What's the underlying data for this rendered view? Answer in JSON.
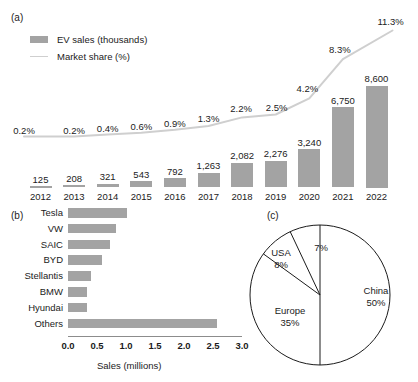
{
  "figure": {
    "panel_a_tag": "(a)",
    "panel_b_tag": "(b)",
    "panel_c_tag": "(c)"
  },
  "colors": {
    "bar_gray": "#a3a3a3",
    "line_gray": "#cfcfcf",
    "text": "#1b1b1b",
    "axis": "#8c8c8c",
    "pie_stroke": "#1b1b1b",
    "pie_fill": "#ffffff"
  },
  "panel_a": {
    "legend": [
      {
        "icon": "bar-swatch",
        "label": "EV sales (thousands)"
      },
      {
        "icon": "line-swatch",
        "label": "Market share (%)"
      }
    ]
  },
  "panel_b": {
    "x_axis_title": "Sales (millions)"
  },
  "chart_data": [
    {
      "id": "panel-a",
      "type": "bar",
      "title": "",
      "xlabel": "",
      "ylabel": "",
      "categories": [
        "2012",
        "2013",
        "2014",
        "2015",
        "2016",
        "2017",
        "2018",
        "2019",
        "2020",
        "2021",
        "2022"
      ],
      "ylim": [
        0,
        8600
      ],
      "grid": false,
      "legend_position": "top-left",
      "series": [
        {
          "name": "EV sales (thousands)",
          "type": "bar",
          "values": [
            125,
            208,
            321,
            543,
            792,
            1263,
            2082,
            2276,
            3240,
            6750,
            8600
          ],
          "data_labels": [
            "125",
            "208",
            "321",
            "543",
            "792",
            "1,263",
            "2,082",
            "2,276",
            "3,240",
            "6,750",
            "8,600"
          ]
        },
        {
          "name": "Market share (%)",
          "type": "line",
          "values": [
            0.2,
            0.2,
            0.4,
            0.6,
            0.9,
            1.3,
            2.2,
            2.5,
            4.2,
            8.3,
            11.3
          ],
          "data_labels": [
            "0.2%",
            "0.2%",
            "0.4%",
            "0.6%",
            "0.9%",
            "1.3%",
            "2.2%",
            "2.5%",
            "4.2%",
            "8.3%",
            "11.3%"
          ],
          "ylim": [
            0,
            11.3
          ]
        }
      ]
    },
    {
      "id": "panel-b",
      "type": "bar",
      "orientation": "horizontal",
      "title": "",
      "xlabel": "Sales (millions)",
      "ylabel": "",
      "categories": [
        "Tesla",
        "VW",
        "SAIC",
        "BYD",
        "Stellantis",
        "BMW",
        "Hyundai",
        "Others"
      ],
      "values": [
        1.02,
        0.82,
        0.73,
        0.59,
        0.4,
        0.33,
        0.32,
        2.57
      ],
      "xlim": [
        0,
        3.0
      ],
      "xticks": [
        0.0,
        0.5,
        1.0,
        1.5,
        2.0,
        2.5,
        3.0
      ],
      "xticklabels": [
        "0.0",
        "0.5",
        "1.0",
        "1.5",
        "2.0",
        "2.5",
        "3.0"
      ],
      "grid": false,
      "legend_position": "none"
    },
    {
      "id": "panel-c",
      "type": "pie",
      "title": "",
      "labels": [
        "China",
        "Europe",
        "USA",
        ""
      ],
      "values": [
        50,
        35,
        8,
        7
      ],
      "value_labels": [
        "50%",
        "35%",
        "8%",
        "7%"
      ],
      "legend_position": "none",
      "start_angle_deg": 0,
      "direction": "clockwise"
    }
  ]
}
